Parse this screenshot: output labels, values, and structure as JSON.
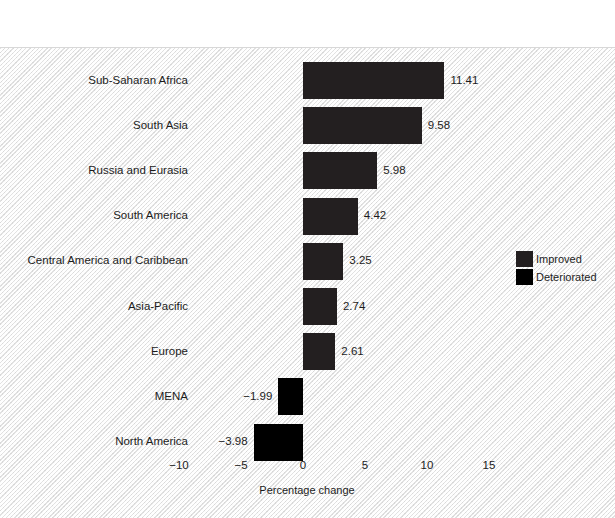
{
  "figure": {
    "title": "Figure 2.15   Change in Health and Wellbeing by region, 2010–2018"
  },
  "chart_data": {
    "type": "bar",
    "orientation": "horizontal",
    "title": "Figure 2.15   Change in Health and Wellbeing by region, 2010–2018",
    "xlabel": "Percentage change",
    "ylabel": "",
    "xlim": [
      -12.5,
      17.5
    ],
    "xticks": [
      -10,
      -5,
      0,
      5,
      10,
      15
    ],
    "xtick_labels": [
      "−10",
      "−5",
      "0",
      "5",
      "10",
      "15"
    ],
    "grid": false,
    "legend_position": "right-middle",
    "categories": [
      "Sub-Saharan Africa",
      "South Asia",
      "Russia and Eurasia",
      "South America",
      "Central America and Caribbean",
      "Asia-Pacific",
      "Europe",
      "MENA",
      "North America"
    ],
    "values": [
      11.41,
      9.58,
      5.98,
      4.42,
      3.25,
      2.74,
      2.61,
      -1.99,
      -3.98
    ],
    "value_labels": [
      "11.41",
      "9.58",
      "5.98",
      "4.42",
      "3.25",
      "2.74",
      "2.61",
      "−1.99",
      "−3.98"
    ],
    "series_assignment": [
      "improved",
      "improved",
      "improved",
      "improved",
      "improved",
      "improved",
      "improved",
      "deteriorated",
      "deteriorated"
    ],
    "legend": [
      {
        "key": "improved",
        "label": "Improved",
        "color": "#231f20"
      },
      {
        "key": "deteriorated",
        "label": "Deteriorated",
        "color": "#000000"
      }
    ]
  }
}
